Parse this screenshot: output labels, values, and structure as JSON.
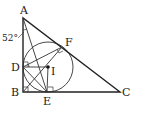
{
  "diagram": {
    "type": "geometry",
    "points": {
      "A": {
        "label": "A",
        "x": 23,
        "y": 18
      },
      "B": {
        "label": "B",
        "x": 23,
        "y": 92
      },
      "C": {
        "label": "C",
        "x": 120,
        "y": 92
      },
      "D": {
        "label": "D",
        "x": 23,
        "y": 67
      },
      "E": {
        "label": "E",
        "x": 47,
        "y": 92
      },
      "F": {
        "label": "F",
        "x": 62,
        "y": 47
      },
      "I": {
        "label": "I",
        "x": 48,
        "y": 67
      }
    },
    "angle_label": "52°",
    "stroke_color": "#222222"
  }
}
